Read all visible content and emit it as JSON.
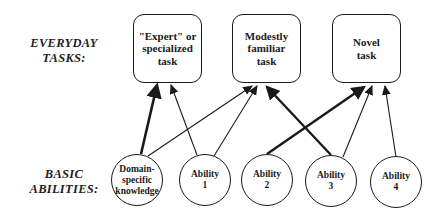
{
  "row_labels": {
    "tasks": "EVERYDAY\nTASKS:",
    "abilities": "BASIC\nABILITIES:"
  },
  "tasks": [
    {
      "id": "expert",
      "label": "\"Expert\" or\nspecialized\ntask"
    },
    {
      "id": "modest",
      "label": "Modestly\nfamiliar\ntask"
    },
    {
      "id": "novel",
      "label": "Novel\ntask"
    }
  ],
  "abilities": [
    {
      "id": "domain",
      "label": "Domain-\nspecific\nknowledge"
    },
    {
      "id": "ab1",
      "label": "Ability\n1"
    },
    {
      "id": "ab2",
      "label": "Ability\n2"
    },
    {
      "id": "ab3",
      "label": "Ability\n3"
    },
    {
      "id": "ab4",
      "label": "Ability\n4"
    }
  ],
  "edges": [
    {
      "from": "domain",
      "to": "expert",
      "weight": "thick"
    },
    {
      "from": "domain",
      "to": "modest",
      "weight": "thin"
    },
    {
      "from": "ab1",
      "to": "expert",
      "weight": "thin"
    },
    {
      "from": "ab1",
      "to": "modest",
      "weight": "thin"
    },
    {
      "from": "ab2",
      "to": "novel",
      "weight": "thick"
    },
    {
      "from": "ab3",
      "to": "modest",
      "weight": "thick"
    },
    {
      "from": "ab3",
      "to": "novel",
      "weight": "thin"
    },
    {
      "from": "ab4",
      "to": "novel",
      "weight": "thin"
    }
  ],
  "colors": {
    "stroke": "#1a1a1a",
    "background": "#ffffff"
  }
}
